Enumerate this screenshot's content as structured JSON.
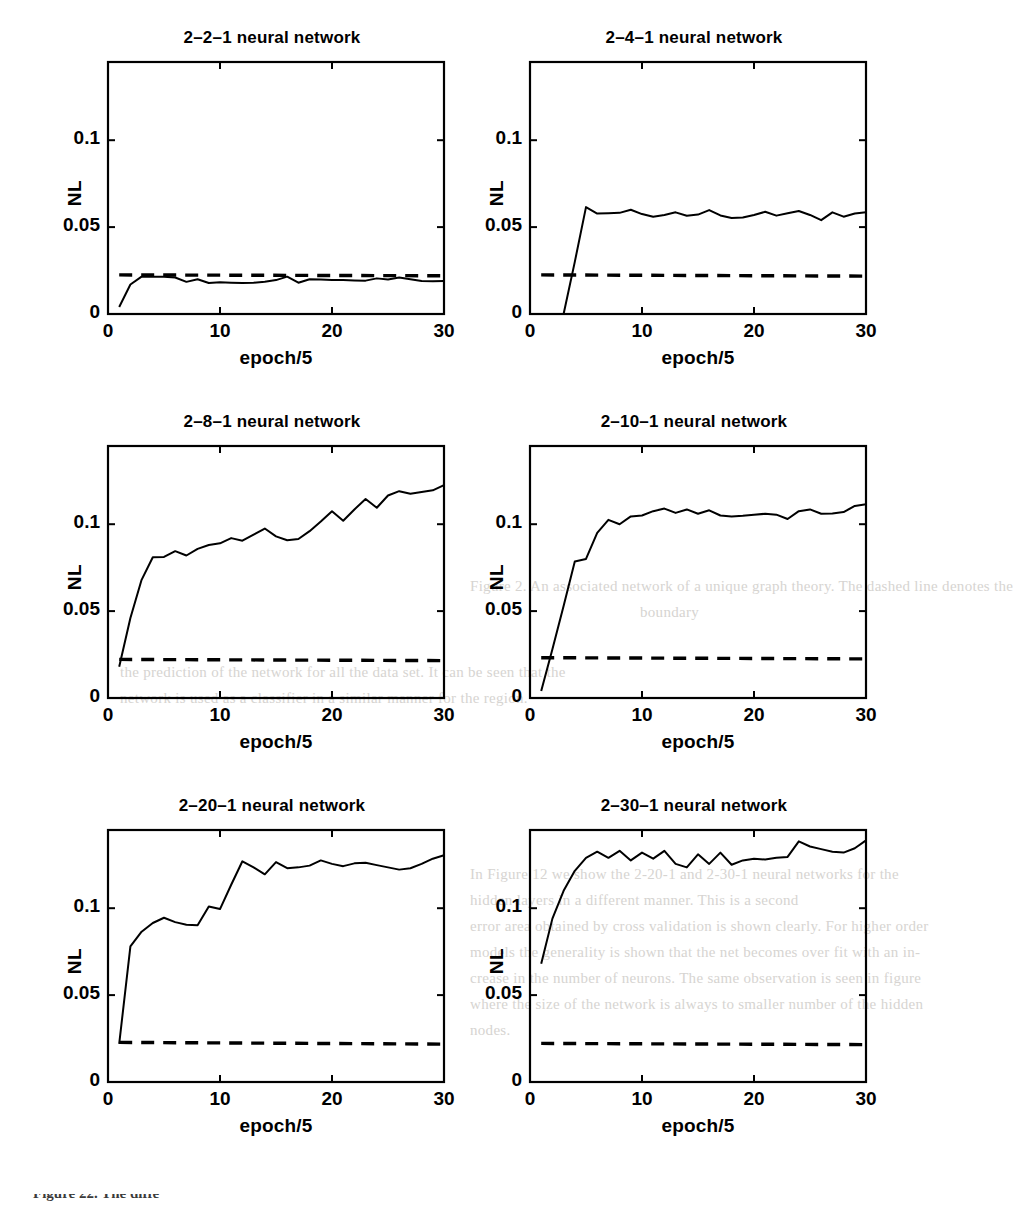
{
  "figure": {
    "background_color": "#ffffff",
    "ink_color": "#000000",
    "caption_partial": "Figure 22.  The diffe"
  },
  "ghost_text": [
    {
      "text": "Figure 2.  An associated network of a unique graph theory.  The dashed line denotes the",
      "x": 470,
      "y": 578
    },
    {
      "text": "boundary",
      "x": 640,
      "y": 604
    },
    {
      "text": "the prediction of the network for all the data set.  It can be seen that the",
      "x": 120,
      "y": 664
    },
    {
      "text": "network is used as a classifier in a similar manner for the region.",
      "x": 120,
      "y": 690
    },
    {
      "text": "In Figure 12 we show the 2-20-1 and 2-30-1 neural networks for the",
      "x": 470,
      "y": 866
    },
    {
      "text": "hidden layers in a different manner.  This is a second",
      "x": 470,
      "y": 892
    },
    {
      "text": "error area obtained by cross validation is shown clearly.  For higher order",
      "x": 470,
      "y": 918
    },
    {
      "text": "models the generality is shown that the net becomes over fit with an in-",
      "x": 470,
      "y": 944
    },
    {
      "text": "crease in the number of neurons.  The same observation is seen in figure",
      "x": 470,
      "y": 970
    },
    {
      "text": "where the size of the network is always to smaller number of the hidden",
      "x": 470,
      "y": 996
    },
    {
      "text": "nodes.",
      "x": 470,
      "y": 1022
    }
  ],
  "chart_data": [
    {
      "id": "panel-2-2-1",
      "type": "line",
      "title": "2–2–1 neural network",
      "xlabel": "epoch/5",
      "ylabel": "NL",
      "xlim": [
        0,
        30
      ],
      "ylim": [
        0,
        0.145
      ],
      "xticks": [
        0,
        10,
        20,
        30
      ],
      "xtick_labels": [
        "0",
        "10",
        "20",
        "30"
      ],
      "yticks": [
        0,
        0.05,
        0.1
      ],
      "ytick_labels": [
        "0",
        "0.05",
        "0.1"
      ],
      "grid": false,
      "legend": "none",
      "series": [
        {
          "name": "training NL",
          "style": "solid",
          "x": [
            1,
            2,
            3,
            4,
            5,
            6,
            7,
            8,
            9,
            10,
            11,
            12,
            13,
            14,
            15,
            16,
            17,
            18,
            19,
            20,
            21,
            22,
            23,
            24,
            25,
            26,
            27,
            28,
            29,
            30
          ],
          "values": [
            0.004,
            0.017,
            0.0215,
            0.0215,
            0.0215,
            0.021,
            0.0185,
            0.02,
            0.0178,
            0.0182,
            0.018,
            0.0178,
            0.018,
            0.0185,
            0.0195,
            0.0215,
            0.018,
            0.02,
            0.0198,
            0.0196,
            0.0195,
            0.0193,
            0.0192,
            0.0205,
            0.0198,
            0.021,
            0.02,
            0.019,
            0.0188,
            0.019
          ]
        },
        {
          "name": "reference NL",
          "style": "dashed",
          "x": [
            1,
            30
          ],
          "values": [
            0.0225,
            0.022
          ]
        }
      ]
    },
    {
      "id": "panel-2-4-1",
      "type": "line",
      "title": "2–4–1 neural network",
      "xlabel": "epoch/5",
      "ylabel": "NL",
      "xlim": [
        0,
        30
      ],
      "ylim": [
        0,
        0.145
      ],
      "xticks": [
        0,
        10,
        20,
        30
      ],
      "xtick_labels": [
        "0",
        "10",
        "20",
        "30"
      ],
      "yticks": [
        0,
        0.05,
        0.1
      ],
      "ytick_labels": [
        "0",
        "0.05",
        "0.1"
      ],
      "grid": false,
      "legend": "none",
      "series": [
        {
          "name": "training NL",
          "style": "solid",
          "x": [
            3,
            4,
            5,
            6,
            7,
            8,
            9,
            10,
            11,
            12,
            13,
            14,
            15,
            16,
            17,
            18,
            19,
            20,
            21,
            22,
            23,
            24,
            25,
            26,
            27,
            28,
            29,
            30
          ],
          "values": [
            0.0,
            0.03,
            0.0615,
            0.0578,
            0.058,
            0.0582,
            0.06,
            0.0575,
            0.056,
            0.057,
            0.0585,
            0.0565,
            0.0572,
            0.0598,
            0.0567,
            0.0552,
            0.0555,
            0.057,
            0.0588,
            0.0566,
            0.058,
            0.0593,
            0.057,
            0.054,
            0.0585,
            0.056,
            0.0578,
            0.0585
          ]
        },
        {
          "name": "reference NL",
          "style": "dashed",
          "x": [
            1,
            30
          ],
          "values": [
            0.0225,
            0.0218
          ]
        }
      ]
    },
    {
      "id": "panel-2-8-1",
      "type": "line",
      "title": "2–8–1 neural network",
      "xlabel": "epoch/5",
      "ylabel": "NL",
      "xlim": [
        0,
        30
      ],
      "ylim": [
        0,
        0.145
      ],
      "xticks": [
        0,
        10,
        20,
        30
      ],
      "xtick_labels": [
        "0",
        "10",
        "20",
        "30"
      ],
      "yticks": [
        0,
        0.05,
        0.1
      ],
      "ytick_labels": [
        "0",
        "0.05",
        "0.1"
      ],
      "grid": false,
      "legend": "none",
      "series": [
        {
          "name": "training NL",
          "style": "solid",
          "x": [
            1,
            2,
            3,
            4,
            5,
            6,
            7,
            8,
            9,
            10,
            11,
            12,
            13,
            14,
            15,
            16,
            17,
            18,
            19,
            20,
            21,
            22,
            23,
            24,
            25,
            26,
            27,
            28,
            29,
            30
          ],
          "values": [
            0.018,
            0.046,
            0.068,
            0.081,
            0.0812,
            0.0845,
            0.082,
            0.0858,
            0.088,
            0.089,
            0.092,
            0.0905,
            0.094,
            0.0975,
            0.093,
            0.0908,
            0.0915,
            0.096,
            0.1015,
            0.1075,
            0.102,
            0.1085,
            0.1145,
            0.1095,
            0.1165,
            0.119,
            0.1175,
            0.1185,
            0.1195,
            0.1225
          ]
        },
        {
          "name": "reference NL",
          "style": "dashed",
          "x": [
            1,
            30
          ],
          "values": [
            0.0222,
            0.0215
          ]
        }
      ]
    },
    {
      "id": "panel-2-10-1",
      "type": "line",
      "title": "2–10–1 neural network",
      "xlabel": "epoch/5",
      "ylabel": "NL",
      "xlim": [
        0,
        30
      ],
      "ylim": [
        0,
        0.145
      ],
      "xticks": [
        0,
        10,
        20,
        30
      ],
      "xtick_labels": [
        "0",
        "10",
        "20",
        "30"
      ],
      "yticks": [
        0,
        0.05,
        0.1
      ],
      "ytick_labels": [
        "0",
        "0.05",
        "0.1"
      ],
      "grid": false,
      "legend": "none",
      "series": [
        {
          "name": "training NL",
          "style": "solid",
          "x": [
            1,
            2,
            3,
            4,
            5,
            6,
            7,
            8,
            9,
            10,
            11,
            12,
            13,
            14,
            15,
            16,
            17,
            18,
            19,
            20,
            21,
            22,
            23,
            24,
            25,
            26,
            27,
            28,
            29,
            30
          ],
          "values": [
            0.004,
            0.028,
            0.053,
            0.0785,
            0.08,
            0.095,
            0.1025,
            0.1,
            0.1045,
            0.105,
            0.1075,
            0.109,
            0.1065,
            0.1085,
            0.106,
            0.108,
            0.105,
            0.1045,
            0.1048,
            0.1055,
            0.106,
            0.1055,
            0.103,
            0.1075,
            0.1085,
            0.106,
            0.1062,
            0.107,
            0.1105,
            0.1115
          ]
        },
        {
          "name": "reference NL",
          "style": "dashed",
          "x": [
            1,
            30
          ],
          "values": [
            0.0232,
            0.0225
          ]
        }
      ]
    },
    {
      "id": "panel-2-20-1",
      "type": "line",
      "title": "2–20–1 neural network",
      "xlabel": "epoch/5",
      "ylabel": "NL",
      "xlim": [
        0,
        30
      ],
      "ylim": [
        0,
        0.145
      ],
      "xticks": [
        0,
        10,
        20,
        30
      ],
      "xtick_labels": [
        "0",
        "10",
        "20",
        "30"
      ],
      "yticks": [
        0,
        0.05,
        0.1
      ],
      "ytick_labels": [
        "0",
        "0.05",
        "0.1"
      ],
      "grid": false,
      "legend": "none",
      "series": [
        {
          "name": "training NL",
          "style": "solid",
          "x": [
            1,
            2,
            3,
            4,
            5,
            6,
            7,
            8,
            9,
            10,
            11,
            12,
            13,
            14,
            15,
            16,
            17,
            18,
            19,
            20,
            21,
            22,
            23,
            24,
            25,
            26,
            27,
            28,
            29,
            30
          ],
          "values": [
            0.022,
            0.078,
            0.0865,
            0.0915,
            0.0945,
            0.092,
            0.0905,
            0.0902,
            0.101,
            0.0995,
            0.1135,
            0.127,
            0.1235,
            0.1195,
            0.1265,
            0.123,
            0.1235,
            0.1245,
            0.1275,
            0.1255,
            0.1242,
            0.1258,
            0.1262,
            0.1248,
            0.1235,
            0.1222,
            0.123,
            0.1255,
            0.1285,
            0.1305
          ]
        },
        {
          "name": "reference NL",
          "style": "dashed",
          "x": [
            1,
            30
          ],
          "values": [
            0.0228,
            0.0218
          ]
        }
      ]
    },
    {
      "id": "panel-2-30-1",
      "type": "line",
      "title": "2–30–1 neural network",
      "xlabel": "epoch/5",
      "ylabel": "NL",
      "xlim": [
        0,
        30
      ],
      "ylim": [
        0,
        0.145
      ],
      "xticks": [
        0,
        10,
        20,
        30
      ],
      "xtick_labels": [
        "0",
        "10",
        "20",
        "30"
      ],
      "yticks": [
        0,
        0.05,
        0.1
      ],
      "ytick_labels": [
        "0",
        "0.05",
        "0.1"
      ],
      "grid": false,
      "legend": "none",
      "series": [
        {
          "name": "training NL",
          "style": "solid",
          "x": [
            1,
            2,
            3,
            4,
            5,
            6,
            7,
            8,
            9,
            10,
            11,
            12,
            13,
            14,
            15,
            16,
            17,
            18,
            19,
            20,
            21,
            22,
            23,
            24,
            25,
            26,
            27,
            28,
            29,
            30
          ],
          "values": [
            0.068,
            0.094,
            0.11,
            0.1215,
            0.129,
            0.1325,
            0.129,
            0.133,
            0.1275,
            0.132,
            0.1285,
            0.133,
            0.1255,
            0.1235,
            0.131,
            0.1255,
            0.132,
            0.125,
            0.1275,
            0.1285,
            0.128,
            0.129,
            0.1295,
            0.1385,
            0.1355,
            0.134,
            0.1325,
            0.132,
            0.1345,
            0.139
          ]
        },
        {
          "name": "reference NL",
          "style": "dashed",
          "x": [
            1,
            30
          ],
          "values": [
            0.0222,
            0.0215
          ]
        }
      ]
    }
  ]
}
